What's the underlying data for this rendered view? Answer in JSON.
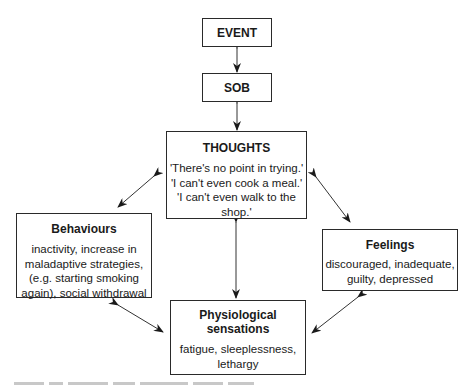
{
  "diagram": {
    "nodes": {
      "event": {
        "title": "EVENT"
      },
      "sob": {
        "title": "SOB"
      },
      "thoughts": {
        "title": "THOUGHTS",
        "lines": [
          "'There's no point in trying.'",
          "'I can't even cook a meal.'",
          "'I can't even walk to the",
          "shop.'"
        ]
      },
      "behaviours": {
        "title": "Behaviours",
        "lines": [
          "inactivity, increase in",
          "maladaptive strategies,",
          "(e.g. starting smoking",
          "again), social withdrawal"
        ]
      },
      "feelings": {
        "title": "Feelings",
        "lines": [
          "discouraged, inadequate,",
          "guilty, depressed"
        ]
      },
      "physiological": {
        "title_lines": [
          "Physiological",
          "sensations"
        ],
        "lines": [
          "fatigue, sleeplessness,",
          "lethargy"
        ]
      }
    },
    "edges": [
      {
        "from": "event",
        "to": "sob",
        "type": "bidirectional"
      },
      {
        "from": "sob",
        "to": "thoughts",
        "type": "bidirectional"
      },
      {
        "from": "thoughts",
        "to": "behaviours",
        "type": "bidirectional"
      },
      {
        "from": "thoughts",
        "to": "feelings",
        "type": "bidirectional"
      },
      {
        "from": "thoughts",
        "to": "physiological",
        "type": "bidirectional"
      },
      {
        "from": "behaviours",
        "to": "physiological",
        "type": "bidirectional"
      },
      {
        "from": "feelings",
        "to": "physiological",
        "type": "bidirectional"
      }
    ],
    "colors": {
      "line": "#2a2a2a",
      "text": "#1a1a1a",
      "background": "#ffffff"
    }
  }
}
